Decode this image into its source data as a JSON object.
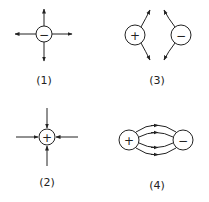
{
  "diagrams": [
    {
      "id": 1,
      "label": "(1)",
      "charges": [
        {
          "sign": "−"
        }
      ],
      "field": "radially outward arrows from negative charge"
    },
    {
      "id": 2,
      "label": "(2)",
      "charges": [
        {
          "sign": "+"
        }
      ],
      "field": "radially inward arrows toward positive charge"
    },
    {
      "id": 3,
      "label": "(3)",
      "charges": [
        {
          "sign": "+"
        },
        {
          "sign": "−"
        }
      ],
      "field": "curved lines bending away from each other"
    },
    {
      "id": 4,
      "label": "(4)",
      "charges": [
        {
          "sign": "+"
        },
        {
          "sign": "−"
        }
      ],
      "field": "curved lines connecting + to − with arrows"
    }
  ],
  "colors": {
    "line": "#222222",
    "background": "#ffffff"
  }
}
